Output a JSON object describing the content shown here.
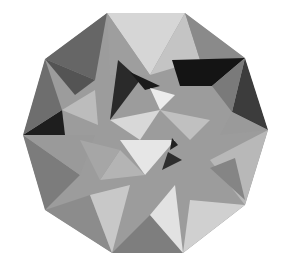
{
  "figure": {
    "background": "#ffffff",
    "outline": [
      [
        107,
        13
      ],
      [
        185,
        13
      ],
      [
        245,
        58
      ],
      [
        268,
        130
      ],
      [
        245,
        205
      ],
      [
        183,
        253
      ],
      [
        112,
        253
      ],
      [
        45,
        210
      ],
      [
        23,
        135
      ],
      [
        45,
        59
      ]
    ],
    "facets": [
      {
        "name": "top-center",
        "points": [
          [
            107,
            13
          ],
          [
            185,
            13
          ],
          [
            150,
            75
          ]
        ],
        "fill": "#d6d6d6"
      },
      {
        "name": "top-center-right",
        "points": [
          [
            150,
            75
          ],
          [
            185,
            13
          ],
          [
            200,
            60
          ]
        ],
        "fill": "#c4c4c4"
      },
      {
        "name": "top-right-upper",
        "points": [
          [
            185,
            13
          ],
          [
            245,
            58
          ],
          [
            200,
            60
          ]
        ],
        "fill": "#8a8a8a"
      },
      {
        "name": "top-right-dark",
        "points": [
          [
            172,
            60
          ],
          [
            245,
            58
          ],
          [
            212,
            86
          ],
          [
            180,
            86
          ]
        ],
        "fill": "#141414"
      },
      {
        "name": "right-upper-dark",
        "points": [
          [
            245,
            58
          ],
          [
            268,
            130
          ],
          [
            232,
            112
          ]
        ],
        "fill": "#3c3c3c"
      },
      {
        "name": "right-upper-mid",
        "points": [
          [
            212,
            86
          ],
          [
            245,
            58
          ],
          [
            232,
            112
          ]
        ],
        "fill": "#7a7a7a"
      },
      {
        "name": "right-middle",
        "points": [
          [
            232,
            112
          ],
          [
            268,
            130
          ],
          [
            220,
            135
          ]
        ],
        "fill": "#9a9a9a"
      },
      {
        "name": "right-lower",
        "points": [
          [
            268,
            130
          ],
          [
            245,
            205
          ],
          [
            210,
            160
          ]
        ],
        "fill": "#b8b8b8"
      },
      {
        "name": "right-lower-dark",
        "points": [
          [
            210,
            168
          ],
          [
            235,
            158
          ],
          [
            245,
            200
          ]
        ],
        "fill": "#858585"
      },
      {
        "name": "bottom-right",
        "points": [
          [
            245,
            205
          ],
          [
            183,
            253
          ],
          [
            190,
            200
          ]
        ],
        "fill": "#d0d0d0"
      },
      {
        "name": "bottom-center",
        "points": [
          [
            112,
            253
          ],
          [
            183,
            253
          ],
          [
            150,
            215
          ]
        ],
        "fill": "#7e7e7e"
      },
      {
        "name": "bottom-center-light",
        "points": [
          [
            150,
            215
          ],
          [
            183,
            253
          ],
          [
            175,
            185
          ]
        ],
        "fill": "#e2e2e2"
      },
      {
        "name": "bottom-left",
        "points": [
          [
            45,
            210
          ],
          [
            112,
            253
          ],
          [
            90,
            195
          ]
        ],
        "fill": "#8c8c8c"
      },
      {
        "name": "bottom-left-light",
        "points": [
          [
            90,
            195
          ],
          [
            112,
            253
          ],
          [
            130,
            185
          ]
        ],
        "fill": "#c8c8c8"
      },
      {
        "name": "left-lower",
        "points": [
          [
            23,
            135
          ],
          [
            45,
            210
          ],
          [
            80,
            175
          ]
        ],
        "fill": "#7c7c7c"
      },
      {
        "name": "left-middle",
        "points": [
          [
            23,
            135
          ],
          [
            80,
            175
          ],
          [
            95,
            135
          ]
        ],
        "fill": "#9a9a9a"
      },
      {
        "name": "left-upper-dark",
        "points": [
          [
            23,
            135
          ],
          [
            65,
            135
          ],
          [
            62,
            110
          ]
        ],
        "fill": "#1e1e1e"
      },
      {
        "name": "left-upper",
        "points": [
          [
            23,
            135
          ],
          [
            45,
            59
          ],
          [
            62,
            110
          ]
        ],
        "fill": "#6e6e6e"
      },
      {
        "name": "top-left",
        "points": [
          [
            45,
            59
          ],
          [
            107,
            13
          ],
          [
            95,
            80
          ]
        ],
        "fill": "#666666"
      },
      {
        "name": "top-left-mid",
        "points": [
          [
            45,
            59
          ],
          [
            95,
            80
          ],
          [
            75,
            95
          ]
        ],
        "fill": "#545454"
      },
      {
        "name": "top-left-light",
        "points": [
          [
            107,
            13
          ],
          [
            150,
            75
          ],
          [
            110,
            75
          ]
        ],
        "fill": "#9e9e9e"
      },
      {
        "name": "left-inner-light",
        "points": [
          [
            62,
            110
          ],
          [
            95,
            90
          ],
          [
            98,
            125
          ]
        ],
        "fill": "#bcbcbc"
      },
      {
        "name": "center-dark-1",
        "points": [
          [
            118,
            60
          ],
          [
            140,
            80
          ],
          [
            110,
            120
          ]
        ],
        "fill": "#2a2a2a"
      },
      {
        "name": "center-dark-2",
        "points": [
          [
            130,
            72
          ],
          [
            160,
            86
          ],
          [
            145,
            90
          ]
        ],
        "fill": "#1a1a1a"
      },
      {
        "name": "center-light",
        "points": [
          [
            150,
            88
          ],
          [
            175,
            95
          ],
          [
            160,
            110
          ]
        ],
        "fill": "#ececec"
      },
      {
        "name": "center-mid",
        "points": [
          [
            110,
            120
          ],
          [
            160,
            110
          ],
          [
            140,
            140
          ]
        ],
        "fill": "#d8d8d8"
      },
      {
        "name": "center-right",
        "points": [
          [
            160,
            110
          ],
          [
            210,
            120
          ],
          [
            190,
            140
          ]
        ],
        "fill": "#c0c0c0"
      },
      {
        "name": "center-lower-light",
        "points": [
          [
            120,
            140
          ],
          [
            175,
            140
          ],
          [
            145,
            175
          ]
        ],
        "fill": "#e6e6e6"
      },
      {
        "name": "center-lower-dark",
        "points": [
          [
            168,
            152
          ],
          [
            182,
            160
          ],
          [
            162,
            170
          ]
        ],
        "fill": "#2e2e2e"
      },
      {
        "name": "center-lower-dark-2",
        "points": [
          [
            172,
            138
          ],
          [
            178,
            145
          ],
          [
            170,
            150
          ]
        ],
        "fill": "#222222"
      },
      {
        "name": "center-lower-mid",
        "points": [
          [
            120,
            150
          ],
          [
            145,
            175
          ],
          [
            100,
            180
          ]
        ],
        "fill": "#b4b4b4"
      },
      {
        "name": "center-left-mid",
        "points": [
          [
            80,
            140
          ],
          [
            120,
            150
          ],
          [
            100,
            180
          ]
        ],
        "fill": "#a6a6a6"
      }
    ]
  }
}
